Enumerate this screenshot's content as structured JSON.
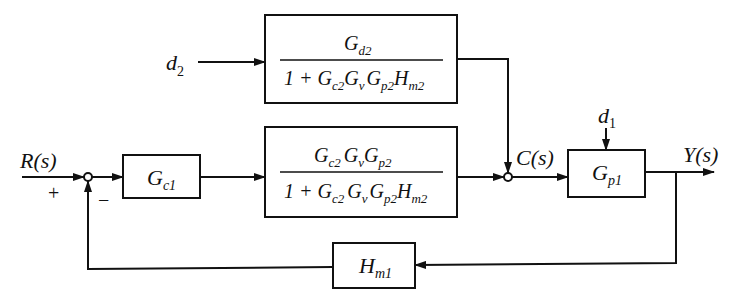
{
  "diagram": {
    "type": "block-diagram",
    "signals": {
      "input": "R(s)",
      "intermediate": "C(s)",
      "output": "Y(s)",
      "disturbance_1": "d",
      "disturbance_1_sub": "1",
      "disturbance_2": "d",
      "disturbance_2_sub": "2"
    },
    "summing_junction_1": {
      "plus_sign": "+",
      "minus_sign": "−"
    },
    "blocks": {
      "controller_1": {
        "main": "G",
        "sub": "c1"
      },
      "disturbance_tf": {
        "numerator": {
          "main": "G",
          "sub": "d2"
        },
        "denominator_prefix": "1 + ",
        "denominator_terms": [
          {
            "main": "G",
            "sub": "c2"
          },
          {
            "main": "G",
            "sub": "v"
          },
          {
            "main": "G",
            "sub": "p2"
          },
          {
            "main": "H",
            "sub": "m2"
          }
        ]
      },
      "inner_loop_tf": {
        "numerator_terms": [
          {
            "main": "G",
            "sub": "c2"
          },
          {
            "main": "G",
            "sub": "v"
          },
          {
            "main": "G",
            "sub": "p2"
          }
        ],
        "denominator_prefix": "1 + ",
        "denominator_terms": [
          {
            "main": "G",
            "sub": "c2"
          },
          {
            "main": "G",
            "sub": "v"
          },
          {
            "main": "G",
            "sub": "p2"
          },
          {
            "main": "H",
            "sub": "m2"
          }
        ]
      },
      "process_1": {
        "main": "G",
        "sub": "p1"
      },
      "measurement_1": {
        "main": "H",
        "sub": "m1"
      }
    },
    "colors": {
      "stroke": "#111111",
      "background": "#ffffff"
    }
  }
}
